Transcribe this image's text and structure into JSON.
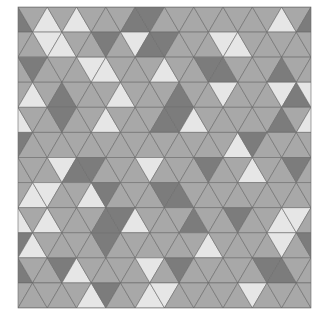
{
  "mosaic": {
    "origin": [
      18,
      7
    ],
    "width": 293,
    "height": 301,
    "rows": 12,
    "cells_per_row": 21,
    "colors": {
      "L": "#e6e6e6",
      "M": "#a8a8a8",
      "D": "#7c7c7c"
    },
    "stroke": "#6a6a6a",
    "grid": [
      "DMLMLMMMDDMMMMMMMMLMD",
      "MMLLMMDMLDDMMMLLMMMMM",
      "MDMMMLLMMMLMMDDMMMDMM",
      "MLMDMMMLMMMDMMLMMMLDL",
      "LMMDMMLMMMDDLMMMMMDML",
      "DMMMMMMMMMMMMMMLDMMMM",
      "MMMLDDMMMLMMMDMMLMMDM",
      "MLLMMLDMMMDDMMMMMMMMM",
      "LMLMMMDDLMMMDMMDMMLLM",
      "DLMMMMDMMMMMMLMMMMLMD",
      "DMMDLMMMMLMDMMMMMDDMM",
      "MMMMMLDMMLLMMMMMLMMMM"
    ]
  }
}
